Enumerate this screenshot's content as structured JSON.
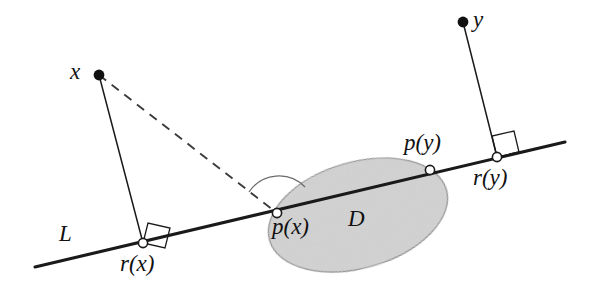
{
  "figure": {
    "type": "geometric-diagram",
    "background_color": "#ffffff",
    "ink_color": "#1a1a1a",
    "region_fill_color": "#d2d2d2",
    "region_stroke_color": "#8a8a8a",
    "labels": {
      "x": "x",
      "y": "y",
      "L": "L",
      "D": "D",
      "r_of_x": "r(x)",
      "r_of_y": "r(y)",
      "p_of_x": "p(x)",
      "p_of_y": "p(y)"
    },
    "points": {
      "x": {
        "cx": 99,
        "cy": 75,
        "style": "filled"
      },
      "y": {
        "cx": 463,
        "cy": 22,
        "style": "filled"
      },
      "r_of_x": {
        "cx": 143,
        "cy": 243,
        "style": "open"
      },
      "r_of_y": {
        "cx": 497,
        "cy": 157,
        "style": "open"
      },
      "p_of_x": {
        "cx": 277,
        "cy": 213,
        "style": "open"
      },
      "p_of_y": {
        "cx": 430,
        "cy": 170,
        "style": "open"
      }
    },
    "line_L": {
      "x1": 35,
      "y1": 267,
      "x2": 565,
      "y2": 142
    },
    "segments": {
      "x_to_rx": {
        "x1": 99,
        "y1": 75,
        "x2": 143,
        "y2": 243,
        "dash": false
      },
      "y_to_ry": {
        "x1": 463,
        "y1": 22,
        "x2": 497,
        "y2": 157,
        "dash": false
      },
      "x_to_px": {
        "x1": 99,
        "y1": 75,
        "x2": 277,
        "y2": 213,
        "dash": true
      }
    },
    "right_angle_markers": [
      {
        "at": "r(x)",
        "size": 22
      },
      {
        "at": "r(y)",
        "size": 22
      }
    ],
    "angle_arc": {
      "at": "p(x)",
      "radius": 34
    },
    "region_D": {
      "cx": 358,
      "cy": 215,
      "rx": 92,
      "ry": 53,
      "rotation_deg": -16
    }
  }
}
